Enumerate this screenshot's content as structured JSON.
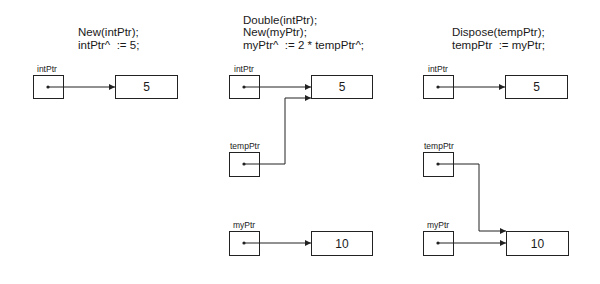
{
  "panels": [
    {
      "code": [
        "New(intPtr);",
        "intPtr^  := 5;"
      ],
      "pointers": [
        {
          "label": "intPtr",
          "target_value": "5"
        }
      ]
    },
    {
      "code": [
        "Double(intPtr);",
        "New(myPtr);",
        "myPtr^  := 2 * tempPtr^;"
      ],
      "pointers": [
        {
          "label": "intPtr",
          "target_value": "5"
        },
        {
          "label": "tempPtr",
          "target_value": "5"
        },
        {
          "label": "myPtr",
          "target_value": "10"
        }
      ]
    },
    {
      "code": [
        "Dispose(tempPtr);",
        "tempPtr  := myPtr;"
      ],
      "pointers": [
        {
          "label": "intPtr",
          "target_value": "5"
        },
        {
          "label": "tempPtr",
          "target_value": "10"
        },
        {
          "label": "myPtr",
          "target_value": "10"
        }
      ]
    }
  ],
  "cells": {
    "p1_int": "5",
    "p2_int": "5",
    "p2_my": "10",
    "p3_int": "5",
    "p3_my": "10"
  },
  "colors": {
    "line": "#222222",
    "background": "#ffffff"
  }
}
